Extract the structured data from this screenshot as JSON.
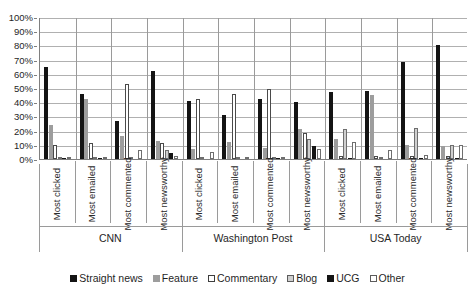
{
  "chart_data": {
    "type": "bar",
    "title": "",
    "xlabel": "",
    "ylabel": "",
    "ylim": [
      0,
      100
    ],
    "grid": true,
    "legend_position": "bottom",
    "ytick_labels": [
      "100%",
      "90%",
      "80%",
      "70%",
      "60%",
      "50%",
      "40%",
      "30%",
      "20%",
      "10%",
      "0%"
    ],
    "ytick_values": [
      100,
      90,
      80,
      70,
      60,
      50,
      40,
      30,
      20,
      10,
      0
    ],
    "groups": [
      {
        "name": "CNN",
        "categories": [
          "Most clicked",
          "Most emailed",
          "Most commented",
          "Most newsworthy"
        ]
      },
      {
        "name": "Washington Post",
        "categories": [
          "Most clicked",
          "Most emailed",
          "Most commented",
          "Most newsworthy"
        ]
      },
      {
        "name": "USA Today",
        "categories": [
          "Most clicked",
          "Most emailed",
          "Most commented",
          "Most newsworthy"
        ]
      }
    ],
    "categories": [
      "Most clicked",
      "Most emailed",
      "Most commented",
      "Most newsworthy",
      "Most clicked",
      "Most emailed",
      "Most commented",
      "Most newsworthy",
      "Most clicked",
      "Most emailed",
      "Most commented",
      "Most newsworthy"
    ],
    "series": [
      {
        "name": "Straight news",
        "color": "#141414",
        "values": [
          65,
          46,
          27,
          62,
          41,
          31,
          42,
          40,
          47,
          48,
          68,
          80
        ]
      },
      {
        "name": "Feature",
        "color": "#9d9d9d",
        "values": [
          24,
          42,
          16,
          13,
          7,
          12,
          8,
          21,
          14,
          45,
          10,
          9
        ]
      },
      {
        "name": "Commentary",
        "color": "#ffffff",
        "values": [
          10,
          11,
          53,
          11,
          42,
          46,
          49,
          18,
          2,
          2,
          2,
          2
        ]
      },
      {
        "name": "Blog",
        "color": "#cfcfcf",
        "values": [
          0,
          0,
          0,
          6,
          1,
          1,
          0,
          14,
          21,
          1,
          22,
          10
        ]
      },
      {
        "name": "UCG",
        "color": "#141414",
        "values": [
          1,
          1,
          0,
          4,
          0,
          0,
          1,
          9,
          1,
          0,
          1,
          1
        ]
      },
      {
        "name": "Other",
        "color": "#ffffff",
        "values": [
          0,
          0,
          6,
          2,
          5,
          1,
          0,
          7,
          12,
          6,
          3,
          10
        ]
      }
    ]
  }
}
